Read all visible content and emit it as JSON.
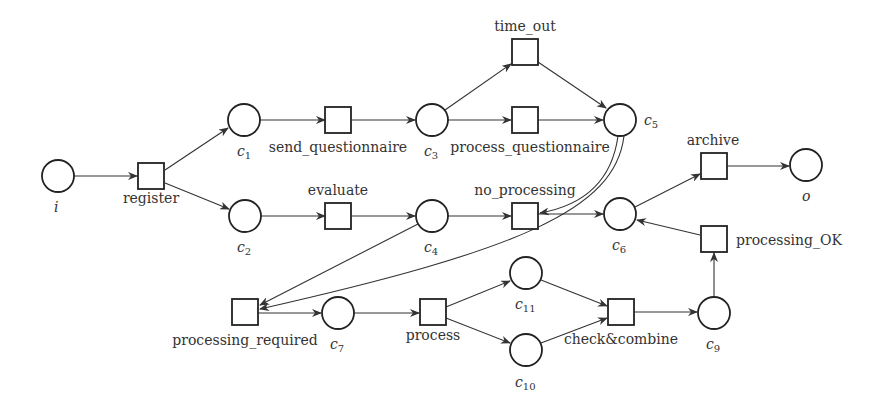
{
  "diagram": {
    "type": "petri-net",
    "places": [
      {
        "id": "i",
        "label": "i",
        "sub": "",
        "x": 58,
        "y": 176
      },
      {
        "id": "c1",
        "label": "c",
        "sub": "1",
        "x": 244,
        "y": 120
      },
      {
        "id": "c2",
        "label": "c",
        "sub": "2",
        "x": 245,
        "y": 216
      },
      {
        "id": "c3",
        "label": "c",
        "sub": "3",
        "x": 432,
        "y": 120
      },
      {
        "id": "c4",
        "label": "c",
        "sub": "4",
        "x": 432,
        "y": 216
      },
      {
        "id": "c5",
        "label": "c",
        "sub": "5",
        "x": 620,
        "y": 120
      },
      {
        "id": "c6",
        "label": "c",
        "sub": "6",
        "x": 620,
        "y": 214
      },
      {
        "id": "c7",
        "label": "c",
        "sub": "7",
        "x": 338,
        "y": 313
      },
      {
        "id": "c9",
        "label": "c",
        "sub": "9",
        "x": 714,
        "y": 313
      },
      {
        "id": "c10",
        "label": "c",
        "sub": "10",
        "x": 526,
        "y": 350
      },
      {
        "id": "c11",
        "label": "c",
        "sub": "11",
        "x": 526,
        "y": 273
      },
      {
        "id": "o",
        "label": "o",
        "sub": "",
        "x": 806,
        "y": 165
      }
    ],
    "transitions": [
      {
        "id": "register",
        "label": "register",
        "x": 151,
        "y": 176
      },
      {
        "id": "send_questionnaire",
        "label": "send_questionnaire",
        "x": 338,
        "y": 120
      },
      {
        "id": "time_out",
        "label": "time_out",
        "x": 525,
        "y": 52
      },
      {
        "id": "process_questionnaire",
        "label": "process_questionnaire",
        "x": 525,
        "y": 120
      },
      {
        "id": "evaluate",
        "label": "evaluate",
        "x": 338,
        "y": 216
      },
      {
        "id": "no_processing",
        "label": "no_processing",
        "x": 525,
        "y": 216
      },
      {
        "id": "archive",
        "label": "archive",
        "x": 713,
        "y": 166
      },
      {
        "id": "processing_OK",
        "label": "processing_OK",
        "x": 713,
        "y": 239
      },
      {
        "id": "processing_required",
        "label": "processing_required",
        "x": 245,
        "y": 312
      },
      {
        "id": "process",
        "label": "process",
        "x": 432,
        "y": 312
      },
      {
        "id": "check_combine",
        "label": "check&combine",
        "x": 621,
        "y": 312
      }
    ],
    "arcs": [
      [
        "i",
        "register"
      ],
      [
        "register",
        "c1"
      ],
      [
        "register",
        "c2"
      ],
      [
        "c1",
        "send_questionnaire"
      ],
      [
        "send_questionnaire",
        "c3"
      ],
      [
        "c3",
        "time_out"
      ],
      [
        "c3",
        "process_questionnaire"
      ],
      [
        "time_out",
        "c5"
      ],
      [
        "process_questionnaire",
        "c5"
      ],
      [
        "c2",
        "evaluate"
      ],
      [
        "evaluate",
        "c4"
      ],
      [
        "c4",
        "no_processing"
      ],
      [
        "c5",
        "no_processing"
      ],
      [
        "no_processing",
        "c6"
      ],
      [
        "c4",
        "processing_required"
      ],
      [
        "c5",
        "processing_required"
      ],
      [
        "processing_required",
        "c7"
      ],
      [
        "c7",
        "process"
      ],
      [
        "process",
        "c11"
      ],
      [
        "process",
        "c10"
      ],
      [
        "c11",
        "check_combine"
      ],
      [
        "c10",
        "check_combine"
      ],
      [
        "check_combine",
        "c9"
      ],
      [
        "c9",
        "processing_OK"
      ],
      [
        "processing_OK",
        "c6"
      ],
      [
        "c6",
        "archive"
      ],
      [
        "archive",
        "o"
      ]
    ]
  },
  "labels": {
    "i": "i",
    "o": "o",
    "c": "c",
    "sub1": "1",
    "sub2": "2",
    "sub3": "3",
    "sub4": "4",
    "sub5": "5",
    "sub6": "6",
    "sub7": "7",
    "sub9": "9",
    "sub10": "10",
    "sub11": "11",
    "register": "register",
    "send_questionnaire": "send_questionnaire",
    "time_out": "time_out",
    "process_questionnaire": "process_questionnaire",
    "evaluate": "evaluate",
    "no_processing": "no_processing",
    "archive": "archive",
    "processing_OK": "processing_OK",
    "processing_required": "processing_required",
    "process": "process",
    "check_combine": "check&combine"
  }
}
